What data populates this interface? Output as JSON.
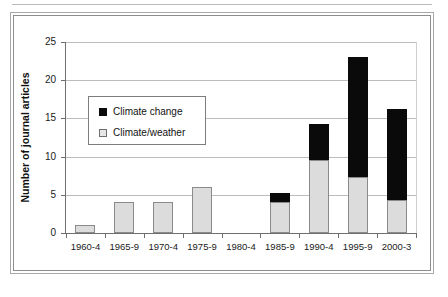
{
  "chart_data": {
    "type": "bar",
    "subtype": "stacked-vertical",
    "title": "",
    "xlabel": "",
    "ylabel": "Number of journal articles",
    "ylim": [
      0,
      25
    ],
    "yticks": [
      0,
      5,
      10,
      15,
      20,
      25
    ],
    "grid": "horizontal",
    "legend_position": "inside-upper-left",
    "categories": [
      "1960-4",
      "1965-9",
      "1970-4",
      "1975-9",
      "1980-4",
      "1985-9",
      "1990-4",
      "1995-9",
      "2000-3"
    ],
    "series": [
      {
        "name": "Climate/weather",
        "color": "#dcdcdc",
        "values": [
          1,
          4,
          4,
          6,
          0,
          4,
          9.5,
          7.3,
          4.3
        ]
      },
      {
        "name": "Climate change",
        "color": "#0a0a0a",
        "values": [
          0,
          0,
          0,
          0,
          0,
          1.3,
          4.8,
          15.7,
          11.9
        ]
      }
    ],
    "totals": [
      1,
      4,
      4,
      6,
      0,
      5.3,
      14.3,
      23,
      16.2
    ]
  },
  "legend": {
    "items": [
      {
        "label": "Climate change",
        "swatch": "dark-square-swatch"
      },
      {
        "label": "Climate/weather",
        "swatch": "light-square-swatch"
      }
    ]
  }
}
